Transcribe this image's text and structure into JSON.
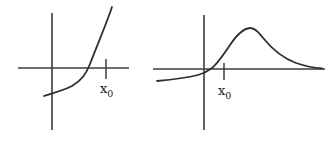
{
  "figure": {
    "background": "#ffffff",
    "axis_ink_color": "#3d3d3d",
    "curve_ink_color": "#2e2e2e",
    "graphs": [
      {
        "id": "left-exponential-growth-plot",
        "x_axis_path": "M18 68 L129 68",
        "y_axis_path": "M52 13 L52 130",
        "tick_path": "M106 59 L106 79",
        "curve_path": "M44 96 C50 94 62 91 72 86 C82 80 86 74 90 64 C96 48 103 32 108 18 C110 13 111 10 112 7",
        "tick_label": {
          "base": "x",
          "sub": "0"
        }
      },
      {
        "id": "right-rise-and-decay-plot",
        "x_axis_path": "M153 69 L325 69",
        "y_axis_path": "M204 15 L204 130",
        "tick_path": "M224 63 L224 80",
        "curve_path": "M157 81 C168 80 186 78 198 75 C204 73.5 208 71 212 68 C218 63 224 54 230 45 C236 36 243 28.5 250 28 C255 27.7 259 33 264 39 C272 49 283 58 296 63 C305 66 315 68 322 68.5",
        "tick_label": {
          "base": "x",
          "sub": "0"
        }
      }
    ]
  },
  "chart_data": [
    {
      "type": "line",
      "title": "",
      "xlabel": "",
      "ylabel": "",
      "grid": false,
      "legend": "none",
      "description": "Hand-drawn sketch of an increasing convex (exponential-like) curve crossing the x-axis left of a marked point x0; units relative to x0 = 1",
      "x_tick_labels": [
        {
          "x": 1,
          "label": "x0"
        }
      ],
      "x": [
        -0.15,
        0,
        0.2,
        0.4,
        0.63,
        0.7,
        0.8,
        0.9,
        1.0,
        1.11
      ],
      "y": [
        -0.52,
        -0.46,
        -0.39,
        -0.28,
        -0.06,
        0.07,
        0.31,
        0.56,
        0.82,
        1.13
      ]
    },
    {
      "type": "line",
      "title": "",
      "xlabel": "",
      "ylabel": "",
      "grid": false,
      "legend": "none",
      "description": "Hand-drawn sketch of a curve starting slightly below the axis, rising through x0 to a rounded peak, then decaying toward the x-axis; units relative to x0 = 1",
      "x_tick_labels": [
        {
          "x": 1,
          "label": "x0"
        }
      ],
      "x": [
        -2.35,
        -1.2,
        0,
        0.35,
        1.0,
        1.55,
        2.3,
        3.0,
        3.95,
        4.8,
        5.9
      ],
      "y": [
        -0.6,
        -0.45,
        -0.25,
        0,
        0.75,
        1.55,
        2.05,
        1.5,
        0.55,
        0.25,
        0.03
      ]
    }
  ]
}
